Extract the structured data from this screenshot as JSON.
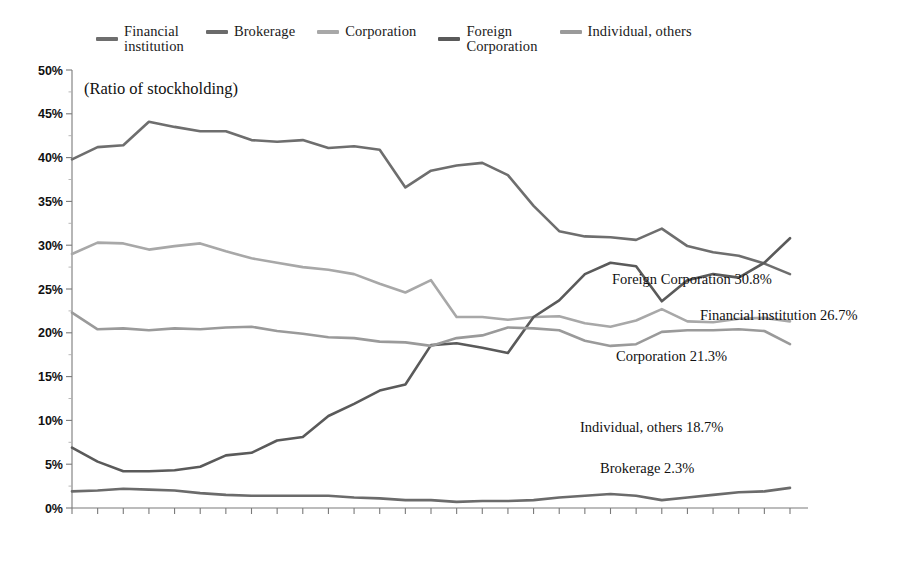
{
  "chart_data": {
    "type": "line",
    "title": "(Ratio of stockholding)",
    "xlabel": "(Fiscal year)",
    "ylabel": "",
    "grid": false,
    "legend_position": "top",
    "ylim": [
      0,
      50
    ],
    "ytick_labels": [
      "0%",
      "5%",
      "10%",
      "15%",
      "20%",
      "25%",
      "30%",
      "35%",
      "40%",
      "45%",
      "50%"
    ],
    "ytick_values": [
      0,
      5,
      10,
      15,
      20,
      25,
      30,
      35,
      40,
      45,
      50
    ],
    "categories": [
      "1985",
      "1986",
      "1987",
      "1988",
      "1989",
      "1990",
      "1991",
      "1992",
      "1993",
      "1994",
      "1995",
      "1996",
      "1997",
      "1998",
      "1999",
      "2000",
      "2001",
      "2002",
      "2003",
      "2004",
      "2005",
      "2006",
      "2007",
      "2008",
      "2009",
      "2010",
      "2011",
      "2012",
      "2013"
    ],
    "series": [
      {
        "name": "Financial institution",
        "color": "#6e6e6e",
        "end_label": "Financial institution 26.7%",
        "end_value": 26.7,
        "values": [
          39.8,
          41.2,
          41.4,
          44.1,
          43.5,
          43.0,
          43.0,
          42.0,
          41.8,
          42.0,
          41.1,
          41.3,
          40.9,
          36.6,
          38.5,
          39.1,
          39.4,
          38.0,
          34.5,
          31.6,
          31.0,
          30.9,
          30.6,
          31.9,
          29.9,
          29.2,
          28.8,
          27.9,
          26.7
        ]
      },
      {
        "name": "Brokerage",
        "color": "#6b6b6b",
        "end_label": "Brokerage 2.3%",
        "end_value": 2.3,
        "values": [
          1.9,
          2.0,
          2.2,
          2.1,
          2.0,
          1.7,
          1.5,
          1.4,
          1.4,
          1.4,
          1.4,
          1.2,
          1.1,
          0.9,
          0.9,
          0.7,
          0.8,
          0.8,
          0.9,
          1.2,
          1.4,
          1.6,
          1.4,
          0.9,
          1.2,
          1.5,
          1.8,
          1.9,
          2.3
        ]
      },
      {
        "name": "Corporation",
        "color": "#a8a8a8",
        "end_label": "Corporation 21.3%",
        "end_value": 21.3,
        "values": [
          29.0,
          30.3,
          30.2,
          29.5,
          29.9,
          30.2,
          29.3,
          28.5,
          28.0,
          27.5,
          27.2,
          26.7,
          25.6,
          24.6,
          26.0,
          21.8,
          21.8,
          21.5,
          21.8,
          21.9,
          21.1,
          20.7,
          21.4,
          22.7,
          21.3,
          21.2,
          21.6,
          21.7,
          21.3
        ]
      },
      {
        "name": "Foreign Corporation",
        "color": "#5a5a5a",
        "end_label": "Foreign Corporation 30.8%",
        "end_value": 30.8,
        "values": [
          6.9,
          5.3,
          4.2,
          4.2,
          4.3,
          4.7,
          6.0,
          6.3,
          7.7,
          8.1,
          10.5,
          11.9,
          13.4,
          14.1,
          18.6,
          18.8,
          18.3,
          17.7,
          21.8,
          23.7,
          26.7,
          28.0,
          27.6,
          23.6,
          26.0,
          26.7,
          26.3,
          28.0,
          30.8
        ]
      },
      {
        "name": "Individual, others",
        "color": "#9a9a9a",
        "end_label": "Individual, others 18.7%",
        "end_value": 18.7,
        "values": [
          22.3,
          20.4,
          20.5,
          20.3,
          20.5,
          20.4,
          20.6,
          20.7,
          20.2,
          19.9,
          19.5,
          19.4,
          19.0,
          18.9,
          18.5,
          19.4,
          19.7,
          20.6,
          20.5,
          20.3,
          19.1,
          18.5,
          18.7,
          20.1,
          20.3,
          20.3,
          20.4,
          20.2,
          18.7
        ]
      }
    ]
  },
  "legend": {
    "items": [
      {
        "label": "Financial\ninstitution",
        "color": "#6e6e6e"
      },
      {
        "label": "Brokerage",
        "color": "#6b6b6b"
      },
      {
        "label": "Corporation",
        "color": "#a8a8a8"
      },
      {
        "label": "Foreign\nCorporation",
        "color": "#5a5a5a"
      },
      {
        "label": "Individual, others",
        "color": "#9a9a9a"
      }
    ]
  },
  "annotations": {
    "foreign_corporation": "Foreign Corporation 30.8%",
    "financial_institution": "Financial institution 26.7%",
    "corporation": "Corporation 21.3%",
    "individual_others": "Individual, others 18.7%",
    "brokerage": "Brokerage 2.3%"
  },
  "axis": {
    "x_caption": "(Fiscal year)",
    "y_caption": "(Ratio of stockholding)"
  }
}
